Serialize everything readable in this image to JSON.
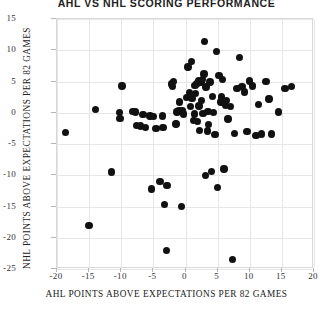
{
  "chart_data": {
    "type": "scatter",
    "title": "AHL VS NHL SCORING PERFORMANCE",
    "xlabel": "AHL POINTS ABOVE EXPECTATIONS PER 82 GAMES",
    "ylabel": "NHL POINTS ABOVE EXPECTATIONS PER 82 GAMES",
    "xlim": [
      -20,
      20
    ],
    "ylim": [
      -25,
      15
    ],
    "xticks": [
      -20,
      -15,
      -10,
      -5,
      0,
      5,
      10,
      15,
      20
    ],
    "yticks": [
      15,
      10,
      5,
      0,
      -5,
      -10,
      -15,
      -20,
      -25
    ],
    "xtick_labels": [
      "-20",
      "-15",
      "-10",
      "-5",
      "0",
      "5",
      "10",
      "15",
      "20"
    ],
    "ytick_labels": [
      "15",
      "10",
      "5",
      "0",
      "-5",
      "-10",
      "-15",
      "-20",
      "-25"
    ],
    "grid": true,
    "legend": "none",
    "marker_color": "#111111",
    "marker_size": 7.4,
    "points": [
      [
        -18.7,
        -3.2
      ],
      [
        -15.0,
        -18.0
      ],
      [
        -14.0,
        0.5
      ],
      [
        -11.5,
        -9.5
      ],
      [
        -10.3,
        0.0
      ],
      [
        -10.2,
        -0.9
      ],
      [
        -9.9,
        4.3
      ],
      [
        -8.2,
        0.2
      ],
      [
        -7.8,
        0.1
      ],
      [
        -7.6,
        -2.0
      ],
      [
        -7.0,
        -2.1
      ],
      [
        -6.6,
        -0.3
      ],
      [
        -6.2,
        -2.4
      ],
      [
        -5.5,
        -0.5
      ],
      [
        -5.3,
        -12.2
      ],
      [
        -5.0,
        -0.6
      ],
      [
        -4.6,
        -2.5
      ],
      [
        -4.0,
        -11.0
      ],
      [
        -3.6,
        -0.5
      ],
      [
        -3.5,
        -2.4
      ],
      [
        -3.3,
        -14.7
      ],
      [
        -3.0,
        -22.0
      ],
      [
        -2.9,
        -11.6
      ],
      [
        -2.2,
        4.6
      ],
      [
        -2.0,
        4.2
      ],
      [
        -1.9,
        5.0
      ],
      [
        -1.5,
        -1.8
      ],
      [
        -1.3,
        0.1
      ],
      [
        -1.0,
        0.4
      ],
      [
        -0.9,
        1.7
      ],
      [
        -0.6,
        -15.0
      ],
      [
        -0.5,
        0.3
      ],
      [
        -0.3,
        -0.2
      ],
      [
        0.2,
        2.4
      ],
      [
        0.4,
        7.3
      ],
      [
        0.6,
        3.2
      ],
      [
        0.8,
        1.0
      ],
      [
        0.9,
        8.2
      ],
      [
        1.0,
        2.3
      ],
      [
        1.2,
        -1.2
      ],
      [
        1.4,
        -0.2
      ],
      [
        1.5,
        4.4
      ],
      [
        1.6,
        3.1
      ],
      [
        1.8,
        4.7
      ],
      [
        1.9,
        -1.4
      ],
      [
        2.0,
        5.1
      ],
      [
        2.1,
        1.1
      ],
      [
        2.2,
        -2.8
      ],
      [
        2.4,
        4.8
      ],
      [
        2.5,
        2.0
      ],
      [
        2.6,
        5.3
      ],
      [
        2.7,
        -0.1
      ],
      [
        2.9,
        6.2
      ],
      [
        3.0,
        11.4
      ],
      [
        3.1,
        -10.0
      ],
      [
        3.2,
        4.1
      ],
      [
        3.4,
        -2.9
      ],
      [
        3.5,
        0.2
      ],
      [
        3.6,
        -1.9
      ],
      [
        3.8,
        4.9
      ],
      [
        4.0,
        -9.4
      ],
      [
        4.2,
        2.6
      ],
      [
        4.4,
        0.0
      ],
      [
        4.6,
        -3.5
      ],
      [
        4.8,
        9.8
      ],
      [
        5.0,
        -12.0
      ],
      [
        5.2,
        6.0
      ],
      [
        5.5,
        1.7
      ],
      [
        5.6,
        2.5
      ],
      [
        5.8,
        5.3
      ],
      [
        6.0,
        -9.0
      ],
      [
        6.2,
        1.2
      ],
      [
        6.4,
        2.0
      ],
      [
        6.6,
        -1.0
      ],
      [
        7.0,
        1.0
      ],
      [
        7.3,
        -23.5
      ],
      [
        7.6,
        -3.3
      ],
      [
        8.0,
        3.9
      ],
      [
        8.4,
        8.8
      ],
      [
        8.8,
        4.2
      ],
      [
        9.2,
        3.3
      ],
      [
        9.6,
        -3.0
      ],
      [
        10.0,
        5.1
      ],
      [
        10.4,
        4.3
      ],
      [
        11.0,
        -3.6
      ],
      [
        11.4,
        1.3
      ],
      [
        11.8,
        -3.4
      ],
      [
        12.5,
        5.0
      ],
      [
        13.0,
        2.2
      ],
      [
        13.4,
        -3.4
      ],
      [
        14.5,
        0.1
      ],
      [
        15.5,
        3.9
      ],
      [
        16.5,
        4.2
      ]
    ]
  }
}
